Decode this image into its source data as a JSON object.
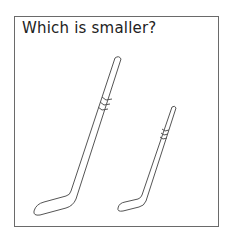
{
  "question": {
    "title": "Which is smaller?"
  },
  "items": [
    {
      "name": "large-hockey-stick",
      "size": "large"
    },
    {
      "name": "small-hockey-stick",
      "size": "small"
    }
  ],
  "colors": {
    "border": "#6a6a6a",
    "stroke": "#555555",
    "background": "#ffffff"
  }
}
